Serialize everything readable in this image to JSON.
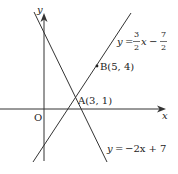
{
  "diagram": {
    "type": "coordinate-plane-lines",
    "origin_label": "O",
    "x_axis_label": "x",
    "y_axis_label": "y",
    "lines": [
      {
        "name": "line-1",
        "equation_lhs": "y =",
        "equation_rhs": "−2x + 7",
        "slope": -2,
        "intercept": 7
      },
      {
        "name": "line-2",
        "equation_lhs": "y =",
        "slope_num": "3",
        "slope_den": "2",
        "var": "x",
        "minus": "−",
        "const_num": "7",
        "const_den": "2",
        "slope": 1.5,
        "intercept": -3.5
      }
    ],
    "points": [
      {
        "label": "A(3, 1)",
        "x": 3,
        "y": 1
      },
      {
        "label": "B(5, 4)",
        "x": 5,
        "y": 4
      }
    ],
    "colors": {
      "line": "#333333",
      "text": "#222222"
    }
  }
}
